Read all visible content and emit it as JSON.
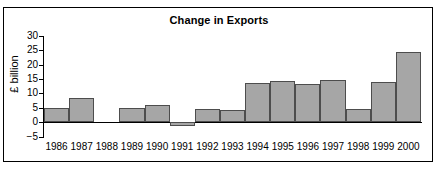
{
  "chart_data": {
    "type": "bar",
    "title": "Change in Exports",
    "xlabel": "",
    "ylabel": "£ billion",
    "categories": [
      "1986",
      "1987",
      "1988",
      "1989",
      "1990",
      "1991",
      "1992",
      "1993",
      "1994",
      "1995",
      "1996",
      "1997",
      "1998",
      "1999",
      "2000"
    ],
    "values": [
      5,
      8.5,
      0,
      4.8,
      6,
      -1.5,
      4.7,
      4.2,
      13.5,
      14.3,
      13.4,
      14.6,
      4.5,
      14,
      24.3
    ],
    "ylim": [
      -5,
      30
    ],
    "yticks": [
      30,
      25,
      20,
      15,
      10,
      5,
      0,
      -5
    ],
    "ytick_labels": [
      "30",
      "25",
      "20",
      "15",
      "10",
      "5",
      "0",
      "−5"
    ],
    "grid": false,
    "legend": "none"
  },
  "colors": {
    "bar_fill": "#a6a6a6",
    "bar_stroke": "#4d4d4d",
    "axis": "#000000",
    "frame": "#000000",
    "background": "#ffffff"
  }
}
